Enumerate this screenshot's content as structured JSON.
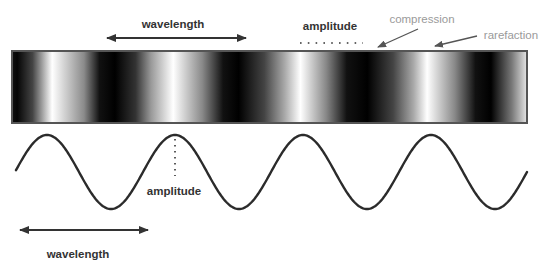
{
  "diagram": {
    "labels": {
      "top_wavelength": "wavelength",
      "top_amplitude": "amplitude",
      "compression": "compression",
      "rarefaction": "rarefaction",
      "wave_amplitude": "amplitude",
      "bottom_wavelength": "wavelength"
    },
    "colors": {
      "text_dark": "#333333",
      "text_light": "#9a9a9a",
      "arrow_dark": "#333333",
      "arrow_light": "#555555",
      "bar_border": "#555555",
      "wave_stroke": "#2b2b2b",
      "compression_shade": "#000000",
      "rarefaction_shade": "#ffffff"
    },
    "wave": {
      "cycles": 4,
      "start_phase_deg": -90,
      "description": "sine wave aligned with bands; peaks correspond to rarefactions (light bands)"
    }
  }
}
